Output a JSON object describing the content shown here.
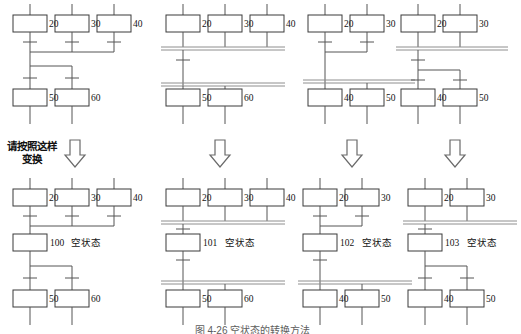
{
  "figure": {
    "caption": "图 4-26  空状态的转换方法",
    "instruction_line1": "请按照这样",
    "instruction_line2": "变换",
    "empty_state_text": "空状态",
    "arrow_icon": "down-block-arrow",
    "colors": {
      "line": "#555555",
      "box_border": "#3a3a3a",
      "double_line": "#8e8e8e",
      "text": "#131313"
    }
  },
  "panels": {
    "top": [
      {
        "id": "top-1",
        "name": "single-convergence-single-divergence-before",
        "upper_steps": [
          {
            "label": "20"
          },
          {
            "label": "30"
          },
          {
            "label": "40"
          }
        ],
        "lower_steps": [
          {
            "label": "50"
          },
          {
            "label": "60"
          }
        ],
        "convergence_type": "single",
        "divergence_type": "single"
      },
      {
        "id": "top-2",
        "name": "double-convergence-double-divergence-before",
        "upper_steps": [
          {
            "label": "20"
          },
          {
            "label": "30"
          },
          {
            "label": "40"
          }
        ],
        "lower_steps": [
          {
            "label": "50"
          },
          {
            "label": "60"
          }
        ],
        "convergence_type": "double",
        "divergence_type": "double"
      },
      {
        "id": "top-3",
        "name": "single-convergence-double-divergence-before",
        "upper_steps": [
          {
            "label": "20"
          },
          {
            "label": "30"
          }
        ],
        "lower_steps": [
          {
            "label": "40"
          },
          {
            "label": "50"
          }
        ],
        "convergence_type": "single",
        "divergence_type": "double"
      },
      {
        "id": "top-4",
        "name": "double-convergence-single-divergence-before",
        "upper_steps": [
          {
            "label": "20"
          },
          {
            "label": "30"
          }
        ],
        "lower_steps": [
          {
            "label": "40"
          },
          {
            "label": "50"
          }
        ],
        "convergence_type": "double",
        "divergence_type": "single"
      }
    ],
    "bottom": [
      {
        "id": "bottom-1",
        "name": "single-convergence-single-divergence-after",
        "upper_steps": [
          {
            "label": "20"
          },
          {
            "label": "30"
          },
          {
            "label": "40"
          }
        ],
        "middle_step": {
          "number": "100",
          "text": "空状态"
        },
        "lower_steps": [
          {
            "label": "50"
          },
          {
            "label": "60"
          }
        ],
        "convergence_type": "single",
        "divergence_type": "single"
      },
      {
        "id": "bottom-2",
        "name": "double-convergence-double-divergence-after",
        "upper_steps": [
          {
            "label": "20"
          },
          {
            "label": "30"
          },
          {
            "label": "40"
          }
        ],
        "middle_step": {
          "number": "101",
          "text": "空状态"
        },
        "lower_steps": [
          {
            "label": "50"
          },
          {
            "label": "60"
          }
        ],
        "convergence_type": "double",
        "divergence_type": "double"
      },
      {
        "id": "bottom-3",
        "name": "single-convergence-double-divergence-after",
        "upper_steps": [
          {
            "label": "20"
          },
          {
            "label": "30"
          }
        ],
        "middle_step": {
          "number": "102",
          "text": "空状态"
        },
        "lower_steps": [
          {
            "label": "40"
          },
          {
            "label": "50"
          }
        ],
        "convergence_type": "single",
        "divergence_type": "double"
      },
      {
        "id": "bottom-4",
        "name": "double-convergence-single-divergence-after",
        "upper_steps": [
          {
            "label": "20"
          },
          {
            "label": "30"
          }
        ],
        "middle_step": {
          "number": "103",
          "text": "空状态"
        },
        "lower_steps": [
          {
            "label": "40"
          },
          {
            "label": "50"
          }
        ],
        "convergence_type": "double",
        "divergence_type": "single"
      }
    ]
  }
}
